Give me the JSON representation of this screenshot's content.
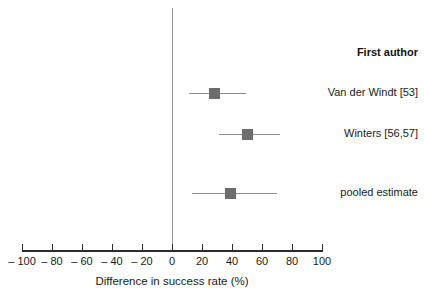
{
  "chart_data": {
    "type": "scatter",
    "subtype": "forest-plot",
    "title": "",
    "xlabel": "Difference in success rate (%)",
    "ylabel": "",
    "xlim": [
      -100,
      100
    ],
    "xticks": [
      -100,
      -80,
      -60,
      -40,
      -20,
      0,
      20,
      40,
      60,
      80,
      100
    ],
    "xticklabels": [
      "– 100",
      "– 80",
      "– 60",
      "– 40",
      "– 20",
      "0",
      "20",
      "40",
      "60",
      "80",
      "100"
    ],
    "grid": false,
    "reference_line": 0,
    "legend": "none",
    "column_header": "First author",
    "marker_color": "#6d6d6d",
    "ci_color": "#8c8c8c",
    "axis_color": "#2c2c2c",
    "reference_line_color": "#9a9a9a",
    "rows": [
      {
        "label": "Van der Windt [53]",
        "estimate": 28,
        "ci_low": 11,
        "ci_high": 49,
        "y": 93
      },
      {
        "label": "Winters [56,57]",
        "estimate": 50,
        "ci_low": 31,
        "ci_high": 72,
        "y": 134
      },
      {
        "label": "pooled estimate",
        "estimate": 39,
        "ci_low": 13,
        "ci_high": 70,
        "y": 193
      }
    ]
  },
  "labels": {
    "column_header": "First author",
    "axis_title": "Difference in success rate (%)"
  }
}
